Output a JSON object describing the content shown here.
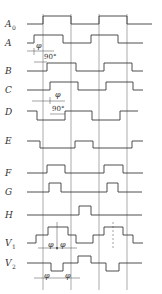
{
  "diagram": {
    "type": "timing-diagram",
    "signals": [
      {
        "id": "A0",
        "label": "A",
        "subscript": "0"
      },
      {
        "id": "A",
        "label": "A",
        "subscript": ""
      },
      {
        "id": "B",
        "label": "B",
        "subscript": ""
      },
      {
        "id": "C",
        "label": "C",
        "subscript": ""
      },
      {
        "id": "D",
        "label": "D",
        "subscript": ""
      },
      {
        "id": "E",
        "label": "E",
        "subscript": ""
      },
      {
        "id": "F",
        "label": "F",
        "subscript": ""
      },
      {
        "id": "G",
        "label": "G",
        "subscript": ""
      },
      {
        "id": "H",
        "label": "H",
        "subscript": ""
      },
      {
        "id": "V1",
        "label": "V",
        "subscript": "1"
      },
      {
        "id": "V2",
        "label": "V",
        "subscript": "2"
      }
    ],
    "annotations": {
      "phi": "φ",
      "deg90": "90°"
    }
  }
}
